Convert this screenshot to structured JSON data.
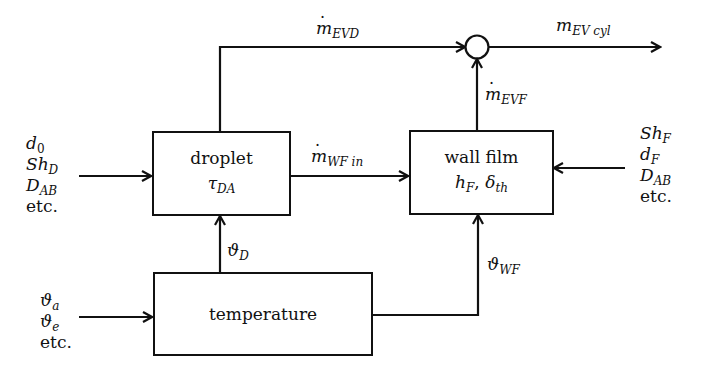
{
  "diagram": {
    "type": "block-diagram",
    "blocks": {
      "droplet": {
        "title": "droplet",
        "param": "τ",
        "param_sub": "DA"
      },
      "wall_film": {
        "title": "wall film",
        "param1": "h",
        "param1_sub": "F",
        "sep": ", ",
        "param2": "δ",
        "param2_sub": "th"
      },
      "temperature": {
        "title": "temperature"
      }
    },
    "signals": {
      "m_evd": {
        "base": "m",
        "sub": "EVD",
        "dotted": true
      },
      "m_ev_cyl": {
        "base": "m",
        "sub": "EV cyl",
        "dotted": false
      },
      "m_evf": {
        "base": "m",
        "sub": "EVF",
        "dotted": true
      },
      "m_wf_in": {
        "base": "m",
        "sub": "WF in",
        "dotted": true
      },
      "theta_d": {
        "base": "ϑ",
        "sub": "D"
      },
      "theta_wf": {
        "base": "ϑ",
        "sub": "WF"
      }
    },
    "inputs": {
      "droplet": [
        {
          "base": "d",
          "sub": "0"
        },
        {
          "base": "Sh",
          "sub": "D"
        },
        {
          "base": "D",
          "sub": "AB"
        },
        {
          "text": "etc."
        }
      ],
      "wall_film": [
        {
          "base": "Sh",
          "sub": "F"
        },
        {
          "base": "d",
          "sub": "F"
        },
        {
          "base": "D",
          "sub": "AB"
        },
        {
          "text": "etc."
        }
      ],
      "temperature": [
        {
          "base": "ϑ",
          "sub": "a"
        },
        {
          "base": "ϑ",
          "sub": "e"
        },
        {
          "text": "etc."
        }
      ]
    },
    "summing_junction": {
      "symbol": "circle"
    },
    "colors": {
      "line": "#111111",
      "background": "#ffffff"
    }
  }
}
